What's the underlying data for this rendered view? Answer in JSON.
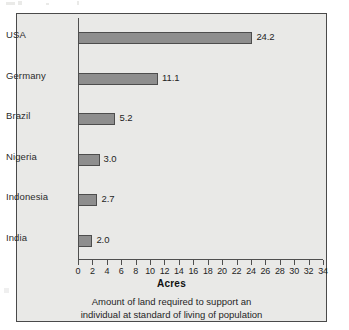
{
  "chart_data": {
    "type": "bar",
    "orientation": "horizontal",
    "title": "",
    "categories": [
      "USA",
      "Germany",
      "Brazil",
      "Nigeria",
      "Indonesia",
      "India"
    ],
    "values": [
      24.2,
      11.1,
      5.2,
      3.0,
      2.7,
      2.0
    ],
    "value_labels": [
      "24.2",
      "11.1",
      "5.2",
      "3.0",
      "2.7",
      "2.0"
    ],
    "xlabel": "Acres",
    "ylabel": "",
    "xlim": [
      0,
      34
    ],
    "xticks": [
      0,
      2,
      4,
      6,
      8,
      10,
      12,
      14,
      16,
      18,
      20,
      22,
      24,
      26,
      28,
      30,
      32,
      34
    ],
    "xtick_labels": [
      "0",
      "2",
      "4",
      "6",
      "8",
      "10",
      "12",
      "14",
      "16",
      "18",
      "20",
      "22",
      "24",
      "26",
      "28",
      "30",
      "32",
      "34"
    ],
    "grid": false,
    "legend": false,
    "bar_color": "#8e8e8e",
    "bar_edge_color": "#4d4d4d",
    "plot_background": "#e9e9e7",
    "frame_color": "#4a4a4a",
    "caption_line_1": "Amount of land required to support an",
    "caption_line_2": "individual at standard of living of population"
  }
}
